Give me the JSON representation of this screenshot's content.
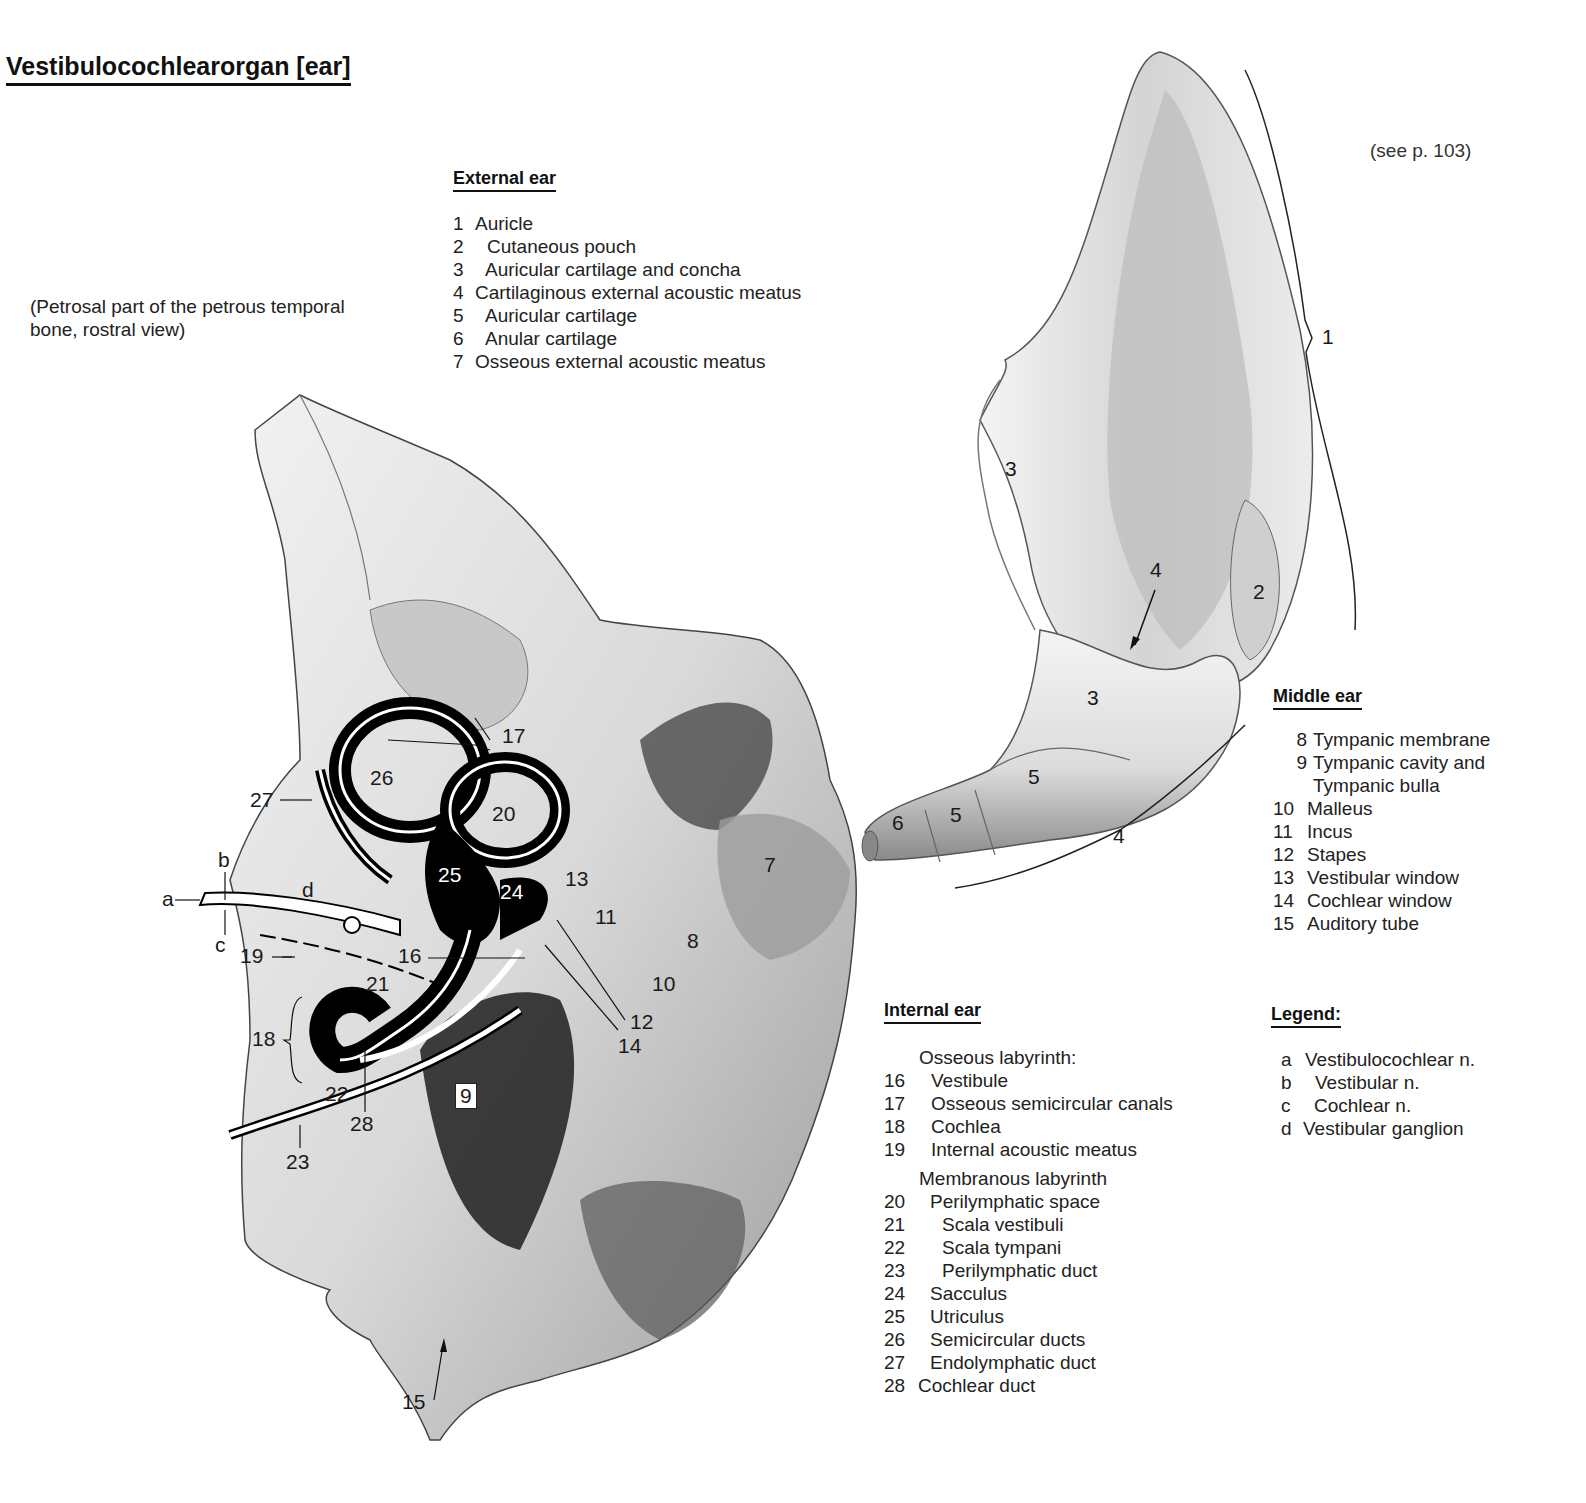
{
  "title": "Vestibulocochlearorgan [ear]",
  "subtitle": "(Petrosal part of the petrous temporal bone, rostral view)",
  "see_reference": "(see p. 103)",
  "external_ear": {
    "heading": "External ear",
    "items": [
      {
        "num": "1",
        "label": "Auricle"
      },
      {
        "num": "2",
        "label": "Cutaneous pouch"
      },
      {
        "num": "3",
        "label": "Auricular cartilage and concha"
      },
      {
        "num": "4",
        "label": "Cartilaginous external acoustic meatus"
      },
      {
        "num": "5",
        "label": "Auricular cartilage"
      },
      {
        "num": "6",
        "label": "Anular cartilage"
      },
      {
        "num": "7",
        "label": "Osseous external acoustic meatus"
      }
    ]
  },
  "middle_ear": {
    "heading": "Middle ear",
    "items": [
      {
        "num": "8",
        "label": "Tympanic membrane"
      },
      {
        "num": "9",
        "label": "Tympanic cavity and"
      },
      {
        "num": "",
        "label": "Tympanic bulla"
      },
      {
        "num": "10",
        "label": "Malleus"
      },
      {
        "num": "11",
        "label": "Incus"
      },
      {
        "num": "12",
        "label": "Stapes"
      },
      {
        "num": "13",
        "label": "Vestibular window"
      },
      {
        "num": "14",
        "label": "Cochlear window"
      },
      {
        "num": "15",
        "label": "Auditory tube"
      }
    ]
  },
  "internal_ear": {
    "heading": "Internal ear",
    "osseous_heading": "Osseous labyrinth:",
    "osseous_items": [
      {
        "num": "16",
        "label": "Vestibule"
      },
      {
        "num": "17",
        "label": "Osseous semicircular canals"
      },
      {
        "num": "18",
        "label": "Cochlea"
      },
      {
        "num": "19",
        "label": "Internal acoustic meatus"
      }
    ],
    "membranous_heading": "Membranous labyrinth",
    "membranous_items": [
      {
        "num": "20",
        "label": "Perilymphatic space",
        "indent": 1
      },
      {
        "num": "21",
        "label": "Scala vestibuli",
        "indent": 2
      },
      {
        "num": "22",
        "label": "Scala tympani",
        "indent": 2
      },
      {
        "num": "23",
        "label": "Perilymphatic duct",
        "indent": 2
      },
      {
        "num": "24",
        "label": "Sacculus",
        "indent": 1
      },
      {
        "num": "25",
        "label": "Utriculus",
        "indent": 1
      },
      {
        "num": "26",
        "label": "Semicircular ducts",
        "indent": 1
      },
      {
        "num": "27",
        "label": "Endolymphatic duct",
        "indent": 1
      },
      {
        "num": "28",
        "label": "Cochlear duct",
        "indent": 0
      }
    ]
  },
  "legend": {
    "heading": "Legend:",
    "items": [
      {
        "key": "a",
        "label": "Vestibulocochlear n."
      },
      {
        "key": "b",
        "label": "Vestibular n."
      },
      {
        "key": "c",
        "label": "Cochlear n."
      },
      {
        "key": "d",
        "label": "Vestibular ganglion"
      }
    ]
  },
  "auricle_labels": {
    "l1": "1",
    "l2": "2",
    "l3a": "3",
    "l3b": "3",
    "l4a": "4",
    "l4b": "4",
    "l5a": "5",
    "l5b": "5",
    "l6": "6"
  },
  "petrous_labels": {
    "l7": "7",
    "l8": "8",
    "l9": "9",
    "l10": "10",
    "l11": "11",
    "l12": "12",
    "l13": "13",
    "l14": "14",
    "l15": "15",
    "l16": "16",
    "l17": "17",
    "l18": "18",
    "l19": "19",
    "l20": "20",
    "l21": "21",
    "l22": "22",
    "l23": "23",
    "l24": "24",
    "l25": "25",
    "l26": "26",
    "l27": "27",
    "l28": "28",
    "la": "a",
    "lb": "b",
    "lc": "c",
    "ld": "d"
  }
}
